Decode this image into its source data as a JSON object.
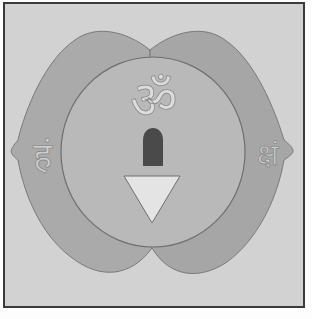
{
  "illustration": {
    "subject": "Ajna chakra",
    "center_symbol": "ॐ",
    "left_petal_letter": "हं",
    "right_petal_letter": "क्षं",
    "colors": {
      "background": "#d2d2d2",
      "border": "#3a3a3a",
      "petal_fill": "#aaaaaa",
      "circle_fill": "#b9b9b9",
      "outline": "#7a7a7a",
      "lingam": "#4a4a4a",
      "triangle": "#e4e4e4",
      "glyph": "#dcdcdc"
    }
  }
}
